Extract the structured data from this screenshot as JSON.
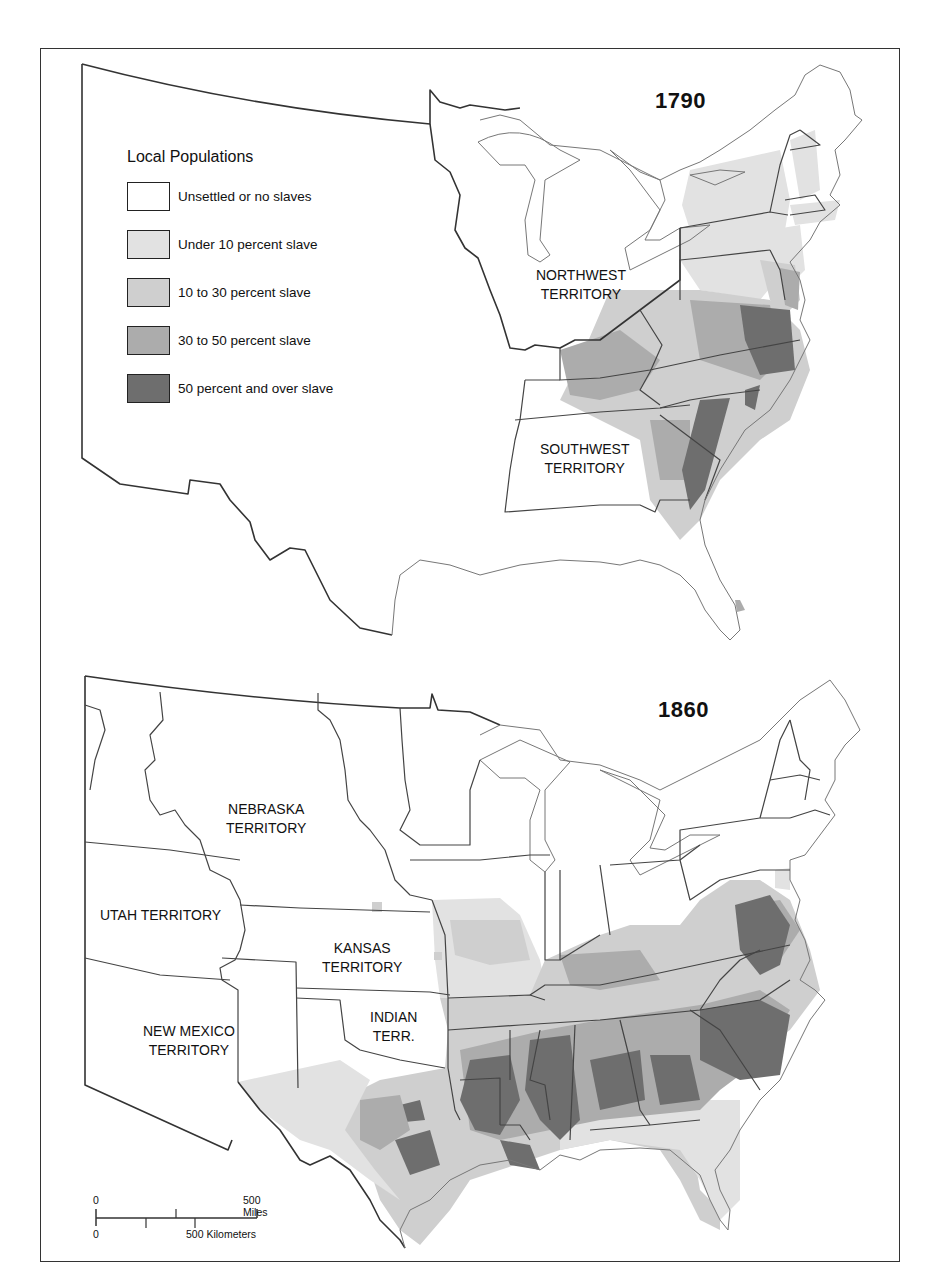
{
  "legend": {
    "title": "Local Populations",
    "items": [
      {
        "label": "Unsettled or no slaves",
        "color": "#ffffff"
      },
      {
        "label": "Under 10 percent slave",
        "color": "#e2e2e2"
      },
      {
        "label": "10 to 30 percent slave",
        "color": "#cfcfcf"
      },
      {
        "label": "30 to 50 percent slave",
        "color": "#acacac"
      },
      {
        "label": "50 percent and over slave",
        "color": "#6e6e6e"
      }
    ]
  },
  "maps": [
    {
      "year": "1790",
      "labels": [
        {
          "line1": "NORTHWEST",
          "line2": "TERRITORY"
        },
        {
          "line1": "SOUTHWEST",
          "line2": "TERRITORY"
        }
      ]
    },
    {
      "year": "1860",
      "labels": [
        {
          "line1": "NEBRASKA",
          "line2": "TERRITORY"
        },
        {
          "line1": "UTAH TERRITORY",
          "line2": ""
        },
        {
          "line1": "KANSAS",
          "line2": "TERRITORY"
        },
        {
          "line1": "INDIAN",
          "line2": "TERR."
        },
        {
          "line1": "NEW MEXICO",
          "line2": "TERRITORY"
        }
      ]
    }
  ],
  "scale_bar": {
    "miles_zero": "0",
    "miles_label": "500 Miles",
    "km_zero": "0",
    "km_label": "500 Kilometers"
  }
}
